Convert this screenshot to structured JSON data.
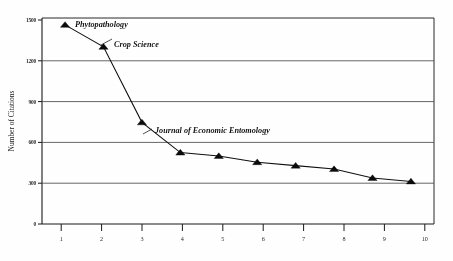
{
  "chart_data": {
    "type": "line",
    "title": "",
    "subtitle": "",
    "xlabel": "",
    "ylabel": "Number of Citations",
    "x": [
      1,
      2,
      3,
      4,
      5,
      6,
      7,
      8,
      9,
      10
    ],
    "values": [
      1450,
      1290,
      740,
      520,
      495,
      450,
      425,
      400,
      335,
      310
    ],
    "series": [
      {
        "name": "Number of Citations",
        "values": [
          1450,
          1290,
          740,
          520,
          495,
          450,
          425,
          400,
          335,
          310
        ]
      }
    ],
    "xlim": [
      0.4,
      10.6
    ],
    "ylim": [
      0,
      1500
    ],
    "ytick_labels": [
      "0",
      "300",
      "600",
      "900",
      "1200",
      "1500"
    ],
    "ytick_values": [
      0,
      300,
      600,
      900,
      1200,
      1500
    ],
    "xtick_labels": [
      "1",
      "2",
      "3",
      "4",
      "5",
      "6",
      "7",
      "8",
      "9",
      "10"
    ],
    "grid": "horizontal",
    "legend": "none",
    "marker": "triangle",
    "line_color": "#111111",
    "marker_color": "#0d0d0d",
    "grid_color": "#555555",
    "background": "#ffffff",
    "annotations": [
      {
        "text": "Phytopathology",
        "point_x": 1,
        "point_y": 1450
      },
      {
        "text": "Crop Science",
        "point_x": 2,
        "point_y": 1290
      },
      {
        "text": "Journal of Economic Entomology",
        "point_x": 3,
        "point_y": 740
      }
    ]
  }
}
